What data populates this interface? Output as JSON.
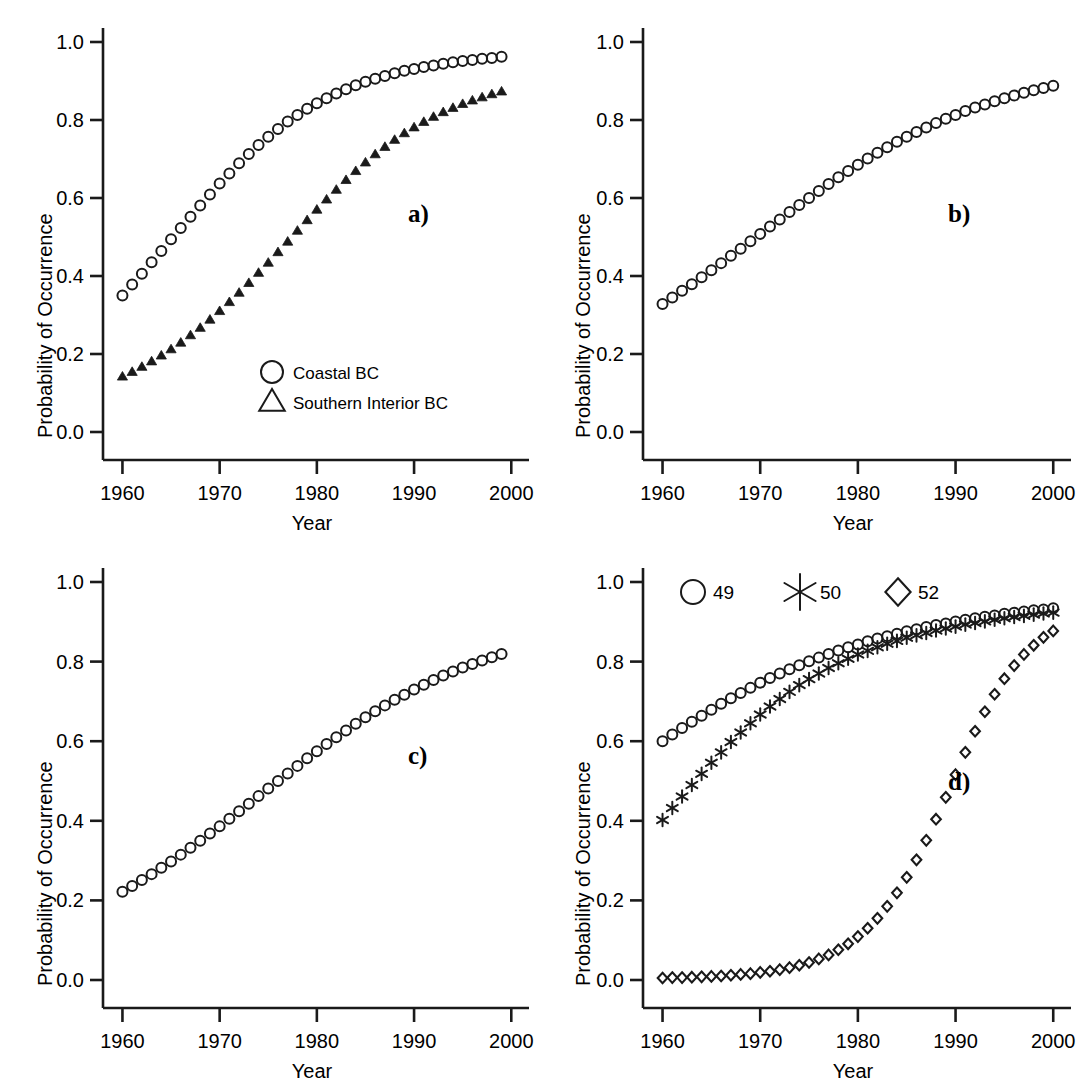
{
  "figure": {
    "axis_color": "#1a1a1a",
    "background": "#ffffff",
    "marker_color": "#1a1a1a"
  },
  "axes_common": {
    "xlabel": "Year",
    "ylabel": "Probability of Occurrence",
    "xticks": [
      "1960",
      "1970",
      "1980",
      "1990",
      "2000"
    ],
    "xtick_values": [
      1960,
      1970,
      1980,
      1990,
      2000
    ],
    "yticks": [
      "0.0",
      "0.2",
      "0.4",
      "0.6",
      "0.8",
      "1.0"
    ],
    "ytick_values": [
      0.0,
      0.2,
      0.4,
      0.6,
      0.8,
      1.0
    ],
    "xlim": [
      1958,
      2001
    ],
    "ylim": [
      0.0,
      1.0
    ],
    "grid": false
  },
  "panels": [
    {
      "tag": "a)",
      "legend": [
        {
          "marker": "circle-open",
          "label": "Coastal BC"
        },
        {
          "marker": "triangle-open",
          "label": "Southern Interior BC"
        }
      ]
    },
    {
      "tag": "b)",
      "legend": []
    },
    {
      "tag": "c)",
      "legend": []
    },
    {
      "tag": "d)",
      "legend": [
        {
          "marker": "circle-open",
          "label": "49"
        },
        {
          "marker": "star",
          "label": "50"
        },
        {
          "marker": "diamond-open",
          "label": "52"
        }
      ]
    }
  ],
  "chart_data": [
    {
      "type": "scatter",
      "panel": "a)",
      "title": "",
      "xlabel": "Year",
      "ylabel": "Probability of Occurrence",
      "xlim": [
        1958,
        2001
      ],
      "ylim": [
        0.0,
        1.0
      ],
      "grid": false,
      "legend_position": "inside-lower-center",
      "x": [
        1960,
        1961,
        1962,
        1963,
        1964,
        1965,
        1966,
        1967,
        1968,
        1969,
        1970,
        1971,
        1972,
        1973,
        1974,
        1975,
        1976,
        1977,
        1978,
        1979,
        1980,
        1981,
        1982,
        1983,
        1984,
        1985,
        1986,
        1987,
        1988,
        1989,
        1990,
        1991,
        1992,
        1993,
        1994,
        1995,
        1996,
        1997,
        1998,
        1999
      ],
      "series": [
        {
          "name": "Coastal BC",
          "marker": "circle-open",
          "values": [
            0.35,
            0.378,
            0.406,
            0.435,
            0.464,
            0.494,
            0.523,
            0.552,
            0.581,
            0.609,
            0.637,
            0.663,
            0.689,
            0.713,
            0.736,
            0.757,
            0.777,
            0.796,
            0.813,
            0.829,
            0.843,
            0.856,
            0.868,
            0.879,
            0.889,
            0.898,
            0.906,
            0.913,
            0.92,
            0.926,
            0.931,
            0.936,
            0.94,
            0.944,
            0.948,
            0.951,
            0.954,
            0.957,
            0.959,
            0.962
          ]
        },
        {
          "name": "Southern Interior BC",
          "marker": "triangle-filled",
          "values": [
            0.142,
            0.154,
            0.167,
            0.181,
            0.196,
            0.212,
            0.229,
            0.248,
            0.267,
            0.288,
            0.31,
            0.333,
            0.357,
            0.382,
            0.408,
            0.434,
            0.461,
            0.488,
            0.516,
            0.543,
            0.57,
            0.596,
            0.621,
            0.646,
            0.669,
            0.691,
            0.712,
            0.731,
            0.749,
            0.766,
            0.781,
            0.795,
            0.808,
            0.82,
            0.831,
            0.841,
            0.85,
            0.858,
            0.866,
            0.873
          ]
        }
      ]
    },
    {
      "type": "scatter",
      "panel": "b)",
      "title": "",
      "xlabel": "Year",
      "ylabel": "Probability of Occurrence",
      "xlim": [
        1958,
        2001
      ],
      "ylim": [
        0.0,
        1.0
      ],
      "grid": false,
      "x": [
        1960,
        1961,
        1962,
        1963,
        1964,
        1965,
        1966,
        1967,
        1968,
        1969,
        1970,
        1971,
        1972,
        1973,
        1974,
        1975,
        1976,
        1977,
        1978,
        1979,
        1980,
        1981,
        1982,
        1983,
        1984,
        1985,
        1986,
        1987,
        1988,
        1989,
        1990,
        1991,
        1992,
        1993,
        1994,
        1995,
        1996,
        1997,
        1998,
        1999,
        2000
      ],
      "series": [
        {
          "name": "panel-b-curve",
          "marker": "circle-open",
          "values": [
            0.328,
            0.345,
            0.362,
            0.379,
            0.397,
            0.415,
            0.433,
            0.452,
            0.47,
            0.489,
            0.508,
            0.527,
            0.545,
            0.564,
            0.582,
            0.6,
            0.618,
            0.636,
            0.653,
            0.669,
            0.685,
            0.701,
            0.716,
            0.73,
            0.744,
            0.757,
            0.769,
            0.781,
            0.792,
            0.803,
            0.813,
            0.823,
            0.832,
            0.84,
            0.848,
            0.856,
            0.863,
            0.87,
            0.876,
            0.882,
            0.888
          ]
        }
      ]
    },
    {
      "type": "scatter",
      "panel": "c)",
      "title": "",
      "xlabel": "Year",
      "ylabel": "Probability of Occurrence",
      "xlim": [
        1958,
        2001
      ],
      "ylim": [
        0.0,
        1.0
      ],
      "grid": false,
      "x": [
        1960,
        1961,
        1962,
        1963,
        1964,
        1965,
        1966,
        1967,
        1968,
        1969,
        1970,
        1971,
        1972,
        1973,
        1974,
        1975,
        1976,
        1977,
        1978,
        1979,
        1980,
        1981,
        1982,
        1983,
        1984,
        1985,
        1986,
        1987,
        1988,
        1989,
        1990,
        1991,
        1992,
        1993,
        1994,
        1995,
        1996,
        1997,
        1998,
        1999
      ],
      "series": [
        {
          "name": "panel-c-curve",
          "marker": "circle-open",
          "values": [
            0.222,
            0.236,
            0.251,
            0.266,
            0.282,
            0.298,
            0.315,
            0.332,
            0.35,
            0.368,
            0.386,
            0.405,
            0.424,
            0.443,
            0.462,
            0.481,
            0.5,
            0.519,
            0.538,
            0.557,
            0.575,
            0.593,
            0.61,
            0.627,
            0.644,
            0.66,
            0.675,
            0.69,
            0.704,
            0.717,
            0.73,
            0.742,
            0.754,
            0.765,
            0.775,
            0.785,
            0.794,
            0.803,
            0.811,
            0.819
          ]
        }
      ]
    },
    {
      "type": "scatter",
      "panel": "d)",
      "title": "",
      "xlabel": "Year",
      "ylabel": "Probability of Occurrence",
      "xlim": [
        1958,
        2001
      ],
      "ylim": [
        0.0,
        1.0
      ],
      "grid": false,
      "legend_position": "top-left-inside",
      "x": [
        1960,
        1961,
        1962,
        1963,
        1964,
        1965,
        1966,
        1967,
        1968,
        1969,
        1970,
        1971,
        1972,
        1973,
        1974,
        1975,
        1976,
        1977,
        1978,
        1979,
        1980,
        1981,
        1982,
        1983,
        1984,
        1985,
        1986,
        1987,
        1988,
        1989,
        1990,
        1991,
        1992,
        1993,
        1994,
        1995,
        1996,
        1997,
        1998,
        1999,
        2000
      ],
      "series": [
        {
          "name": "49",
          "marker": "circle-open",
          "values": [
            0.6,
            0.617,
            0.633,
            0.649,
            0.664,
            0.679,
            0.694,
            0.708,
            0.721,
            0.734,
            0.747,
            0.759,
            0.77,
            0.781,
            0.791,
            0.801,
            0.81,
            0.819,
            0.828,
            0.836,
            0.843,
            0.851,
            0.858,
            0.864,
            0.87,
            0.876,
            0.881,
            0.887,
            0.892,
            0.896,
            0.901,
            0.905,
            0.909,
            0.913,
            0.916,
            0.92,
            0.923,
            0.926,
            0.929,
            0.931,
            0.934
          ]
        },
        {
          "name": "50",
          "marker": "star",
          "values": [
            0.402,
            0.432,
            0.461,
            0.49,
            0.518,
            0.546,
            0.572,
            0.598,
            0.622,
            0.645,
            0.667,
            0.687,
            0.706,
            0.724,
            0.741,
            0.756,
            0.77,
            0.784,
            0.796,
            0.807,
            0.818,
            0.827,
            0.836,
            0.845,
            0.852,
            0.86,
            0.866,
            0.872,
            0.878,
            0.883,
            0.888,
            0.893,
            0.897,
            0.901,
            0.905,
            0.909,
            0.912,
            0.915,
            0.918,
            0.921,
            0.923
          ]
        },
        {
          "name": "52",
          "marker": "diamond-open",
          "values": [
            0.005,
            0.006,
            0.006,
            0.007,
            0.008,
            0.009,
            0.01,
            0.012,
            0.014,
            0.016,
            0.019,
            0.022,
            0.026,
            0.031,
            0.037,
            0.044,
            0.053,
            0.063,
            0.076,
            0.091,
            0.109,
            0.13,
            0.155,
            0.185,
            0.219,
            0.258,
            0.302,
            0.351,
            0.404,
            0.459,
            0.516,
            0.572,
            0.625,
            0.674,
            0.718,
            0.757,
            0.79,
            0.818,
            0.841,
            0.861,
            0.877
          ]
        }
      ]
    }
  ]
}
